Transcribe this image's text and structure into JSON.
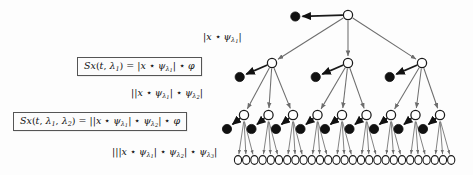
{
  "figure": {
    "name": "scattering-transform-tree",
    "background_color": "#fdfdfd",
    "node_colors": {
      "internal_node_fill": "#ffffff",
      "internal_node_stroke": "#1a1a1a",
      "output_node_fill": "#111111",
      "edge_color": "#6d6d6d",
      "output_edge_color": "#1a1a1a"
    }
  },
  "formulas": [
    {
      "id": "box-level1",
      "text": "Sx(t, λ₁) = |x ⋆ ψ_λ₁| ⋆ φ",
      "lhs": "Sx(t, λ₁)",
      "rhs": "|x ⋆ ψ_λ₁| ⋆ φ",
      "boxed": true
    },
    {
      "id": "box-level2",
      "text": "Sx(t, λ₁, λ₂) = ||x ⋆ ψ_λ₁| ⋆ ψ_λ₂| ⋆ φ",
      "lhs": "Sx(t, λ₁, λ₂)",
      "rhs": "||x ⋆ ψ_λ₁| ⋆ ψ_λ₂| ⋆ φ",
      "boxed": true
    }
  ],
  "path_labels": [
    {
      "id": "label-level1",
      "text": "|x ⋆ ψ_λ₁|",
      "level": 1
    },
    {
      "id": "label-level2",
      "text": "||x ⋆ ψ_λ₁| ⋆ ψ_λ₂|",
      "level": 2
    },
    {
      "id": "label-level3",
      "text": "|||x ⋆ ψ_λ₁| ⋆ ψ_λ₂| ⋆ ψ_λ₃|",
      "level": 3
    }
  ],
  "chart_data": {
    "type": "diagram",
    "subtype": "tree",
    "branching_factor": 3,
    "depth": 3,
    "levels": [
      {
        "level": 0,
        "internal_nodes": 1,
        "output_nodes": 1,
        "label": "x"
      },
      {
        "level": 1,
        "internal_nodes": 3,
        "output_nodes": 3,
        "label": "|x ⋆ ψ_λ₁|"
      },
      {
        "level": 2,
        "internal_nodes": 9,
        "output_nodes": 9,
        "label": "||x ⋆ ψ_λ₁| ⋆ ψ_λ₂|"
      },
      {
        "level": 3,
        "internal_nodes": 27,
        "output_nodes": 0,
        "label": "|||x ⋆ ψ_λ₁| ⋆ ψ_λ₂| ⋆ ψ_λ₃|"
      }
    ],
    "node_counts": {
      "internal_total": 40,
      "output_total": 13
    },
    "geometry": {
      "root": {
        "x": 348,
        "y": 15
      },
      "level1_y": 63,
      "level2_y": 115,
      "level3_y": 160,
      "level1_x": [
        272,
        348,
        422
      ],
      "level2_x_start": 244,
      "level2_x_step": 24.5,
      "level3_x_start": 238,
      "level3_x_step": 8.2,
      "output_offset": {
        "dx": -17,
        "dy": 14
      },
      "node_radius_internal": 4.6,
      "node_radius_output": 4.6,
      "leaf_radius": 3.6
    }
  }
}
